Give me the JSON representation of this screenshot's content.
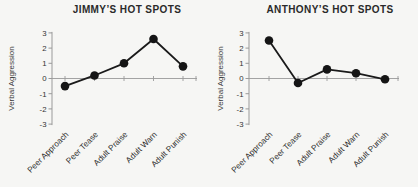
{
  "figure": {
    "background_color": "#f6f6f4",
    "ink_color": "#1a1a1a",
    "axis_color": "#9a9a9a"
  },
  "chart_data": [
    {
      "type": "line",
      "title": "JIMMY’S HOT SPOTS",
      "ylabel": "Verbal Aggression",
      "xlabel": "",
      "categories": [
        "Peer Approach",
        "Peer Tease",
        "Adult Praise",
        "Adult Warn",
        "Adult Punish"
      ],
      "values": [
        -0.5,
        0.2,
        1.0,
        2.6,
        0.8
      ],
      "ylim": [
        -3,
        3
      ],
      "yticks": [
        3,
        2,
        1,
        0,
        -1,
        -2,
        -3
      ],
      "marker": "filled-circle",
      "line_color": "#1a1a1a",
      "axis_color": "#9a9a9a",
      "grid": false,
      "legend": false
    },
    {
      "type": "line",
      "title": "ANTHONY’S HOT SPOTS",
      "ylabel": "Verbal Aggression",
      "xlabel": "",
      "categories": [
        "Peer Approach",
        "Peer Tease",
        "Adult Praise",
        "Adult Warn",
        "Adult Punish"
      ],
      "values": [
        2.5,
        -0.3,
        0.6,
        0.35,
        -0.05
      ],
      "ylim": [
        -3,
        3
      ],
      "yticks": [
        3,
        2,
        1,
        0,
        -1,
        -2,
        -3
      ],
      "marker": "filled-circle",
      "line_color": "#1a1a1a",
      "axis_color": "#9a9a9a",
      "grid": false,
      "legend": false
    }
  ]
}
